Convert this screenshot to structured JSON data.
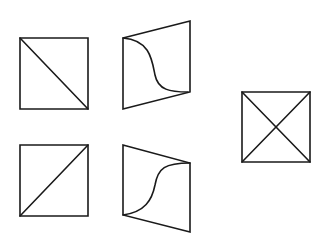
{
  "diagram": {
    "background": "#ffffff",
    "stroke_color": "#1a1a1a",
    "shapes": [
      {
        "id": "square-diag-tl-br",
        "type": "square",
        "points": [
          [
            20,
            38
          ],
          [
            88,
            38
          ],
          [
            88,
            109
          ],
          [
            20,
            109
          ]
        ],
        "lines": [
          [
            [
              20,
              38
            ],
            [
              88,
              109
            ]
          ]
        ]
      },
      {
        "id": "parallelogram-curve-top",
        "type": "parallelogram",
        "points": [
          [
            123,
            38
          ],
          [
            190,
            21
          ],
          [
            190,
            92
          ],
          [
            123,
            109
          ]
        ],
        "curve": "M123,38 C150,40 152,60 155,75 C158,90 170,92 188,92"
      },
      {
        "id": "square-diag-bl-tr",
        "type": "square",
        "points": [
          [
            20,
            145
          ],
          [
            88,
            145
          ],
          [
            88,
            216
          ],
          [
            20,
            216
          ]
        ],
        "lines": [
          [
            [
              20,
              216
            ],
            [
              88,
              145
            ]
          ]
        ]
      },
      {
        "id": "parallelogram-curve-bottom",
        "type": "parallelogram",
        "points": [
          [
            123,
            145
          ],
          [
            190,
            163
          ],
          [
            190,
            232
          ],
          [
            123,
            215
          ]
        ],
        "curve": "M123,215 C145,212 152,200 155,185 C158,168 165,163 190,163"
      },
      {
        "id": "square-both-diagonals",
        "type": "square",
        "points": [
          [
            242,
            92
          ],
          [
            310,
            92
          ],
          [
            310,
            162
          ],
          [
            242,
            162
          ]
        ],
        "lines": [
          [
            [
              242,
              92
            ],
            [
              310,
              162
            ]
          ],
          [
            [
              310,
              92
            ],
            [
              242,
              162
            ]
          ]
        ]
      }
    ]
  }
}
